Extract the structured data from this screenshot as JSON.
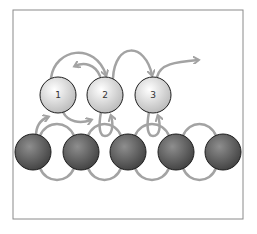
{
  "diagram": {
    "frame": {
      "x": 13,
      "y": 10,
      "w": 230,
      "h": 209,
      "stroke": "#8a8a8a"
    },
    "colors": {
      "arrow": "#a3a3a3",
      "light_ball_hi": "#ffffff",
      "light_ball_lo": "#bcbcbc",
      "dark_ball_hi": "#8a8a8a",
      "dark_ball_lo": "#3d3d3d",
      "outline": "#1e1e1e"
    },
    "top_nodes": [
      {
        "label": "1",
        "cx": 58,
        "cy": 95
      },
      {
        "label": "2",
        "cx": 105,
        "cy": 95
      },
      {
        "label": "3",
        "cx": 153,
        "cy": 95
      }
    ],
    "bottom_nodes": [
      {
        "cx": 33,
        "cy": 152
      },
      {
        "cx": 81,
        "cy": 152
      },
      {
        "cx": 128,
        "cy": 152
      },
      {
        "cx": 176,
        "cy": 152
      },
      {
        "cx": 223,
        "cy": 152
      }
    ],
    "radius": 18
  }
}
